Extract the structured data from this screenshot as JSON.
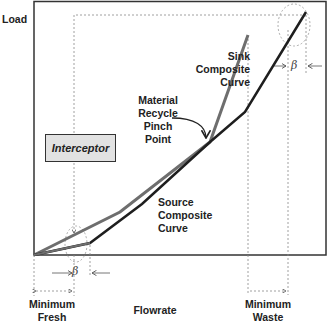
{
  "axes": {
    "y_label": "Load",
    "x_label": "Flowrate"
  },
  "curves": {
    "sink_label": [
      "Sink",
      "Composite",
      "Curve"
    ],
    "source_label": [
      "Source",
      "Composite",
      "Curve"
    ],
    "sink_color": "#6e6e6e",
    "source_color": "#1e1e1e"
  },
  "pinch": {
    "label": [
      "Material",
      "Recycle",
      "Pinch",
      "Point"
    ]
  },
  "interceptor": {
    "label": "Interceptor",
    "fill": "#e2e2e2"
  },
  "annotations": {
    "beta_symbol": "β",
    "minimum_fresh": [
      "Minimum",
      "Fresh"
    ],
    "minimum_waste": [
      "Minimum",
      "Waste"
    ]
  }
}
